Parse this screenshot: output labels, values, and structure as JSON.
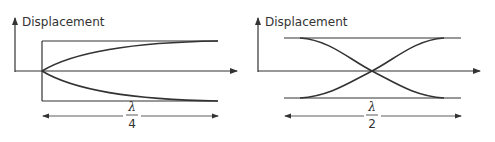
{
  "diagrams": [
    {
      "id": "closed-end-pipe",
      "y_axis_label": "Displacement",
      "length_numerator": "λ",
      "length_denominator": "4",
      "description": "Quarter-wavelength: node at left, antinode at right"
    },
    {
      "id": "open-open-pipe",
      "y_axis_label": "Displacement",
      "length_numerator": "λ",
      "length_denominator": "2",
      "description": "Half-wavelength: antinodes at both ends, node at center"
    }
  ],
  "colors": {
    "line": "#333333",
    "background": "#ffffff"
  }
}
